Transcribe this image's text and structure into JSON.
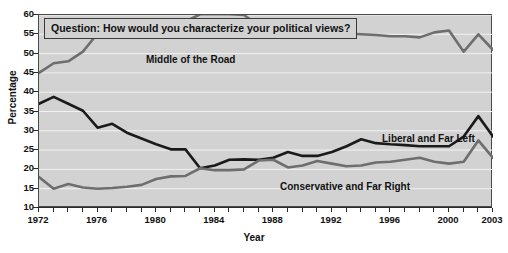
{
  "chart_data": {
    "type": "line",
    "title": "Question: How would you characterize your political views?",
    "xlabel": "Year",
    "ylabel": "Percentage",
    "xlim": [
      1972,
      2003
    ],
    "ylim": [
      10,
      60
    ],
    "yticks": [
      10,
      15,
      20,
      25,
      30,
      35,
      40,
      45,
      50,
      55,
      60
    ],
    "xticks": [
      1972,
      1976,
      1980,
      1984,
      1988,
      1992,
      1996,
      2000,
      2003
    ],
    "xtick_all": [
      1972,
      1973,
      1974,
      1975,
      1976,
      1977,
      1978,
      1979,
      1980,
      1981,
      1982,
      1983,
      1984,
      1985,
      1986,
      1987,
      1988,
      1989,
      1990,
      1991,
      1992,
      1993,
      1994,
      1995,
      1996,
      1997,
      1998,
      1999,
      2000,
      2001,
      2002,
      2003
    ],
    "grid": "horizontal-white",
    "legend": "inline-labels",
    "plot_background": "#d2d2d2",
    "x": [
      1972,
      1973,
      1974,
      1975,
      1976,
      1977,
      1978,
      1979,
      1980,
      1981,
      1982,
      1983,
      1984,
      1985,
      1986,
      1987,
      1988,
      1989,
      1990,
      1991,
      1992,
      1993,
      1994,
      1995,
      1996,
      1997,
      1998,
      1999,
      2000,
      2001,
      2002,
      2003
    ],
    "series": [
      {
        "name": "Middle of the Road",
        "color": "#6e6e6e",
        "values": [
          45.0,
          47.5,
          48.0,
          50.5,
          55.2,
          54.3,
          55.8,
          57.0,
          57.8,
          58.2,
          58.3,
          60.2,
          60.2,
          60.2,
          60.0,
          57.2,
          57.3,
          57.0,
          55.8,
          56.0,
          55.5,
          55.2,
          55.0,
          54.8,
          54.5,
          54.5,
          54.2,
          55.5,
          56.0,
          50.5,
          55.0,
          51.0
        ]
      },
      {
        "name": "Liberal and Far Left",
        "color": "#1a1a1a",
        "values": [
          37.0,
          38.8,
          37.0,
          35.2,
          30.8,
          31.8,
          29.5,
          28.0,
          26.5,
          25.2,
          25.2,
          20.3,
          21.0,
          22.5,
          22.6,
          22.5,
          23.0,
          24.5,
          23.5,
          23.5,
          24.5,
          26.0,
          27.8,
          26.8,
          26.5,
          26.3,
          26.0,
          26.0,
          26.0,
          28.5,
          33.8,
          28.5
        ]
      },
      {
        "name": "Conservative and Far Right",
        "color": "#6e6e6e",
        "values": [
          18.0,
          15.0,
          16.2,
          15.3,
          15.0,
          15.2,
          15.5,
          16.0,
          17.5,
          18.2,
          18.3,
          20.3,
          19.8,
          19.8,
          20.0,
          22.3,
          22.5,
          20.5,
          21.0,
          22.2,
          21.5,
          20.8,
          21.0,
          21.8,
          22.0,
          22.5,
          23.0,
          22.0,
          21.5,
          22.0,
          27.5,
          23.0
        ]
      }
    ]
  },
  "labels": {
    "middle": "Middle of the Road",
    "liberal": "Liberal and Far Left",
    "conservative": "Conservative and Far Right"
  }
}
